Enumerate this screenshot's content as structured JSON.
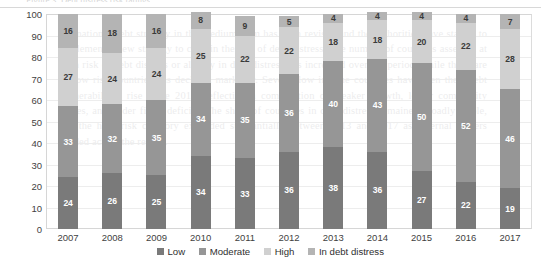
{
  "page": {
    "top_cut_text": "Figure 3. Debt distress risk ratings",
    "bleed_text": "the national debt strategy in the medium term has been revised and the authorities have started to implement a new strategy to contain the risk of debt distress. The number of countries assessed at high risk of debt distress or already in debt distress has increased over the period, while the share of low risk countries has declined markedly. Several low income countries have seen their debt vulnerabilities rise since 2013, reflecting a combination of weaker growth, lower commodity prices, and wider fiscal deficits. The share of countries in debt distress remained broadly stable, but the high risk category expanded substantially between 2013 and 2017 as external buffers eroded across the region."
  },
  "chart_data": {
    "type": "bar",
    "stacked": true,
    "title": "",
    "xlabel": "",
    "ylabel": "",
    "ylim": [
      0,
      100
    ],
    "ytick_step": 10,
    "ytick_labels": [
      "100",
      "90",
      "80",
      "70",
      "60",
      "50",
      "40",
      "30",
      "20",
      "10",
      "0"
    ],
    "grid": true,
    "legend_position": "bottom",
    "categories": [
      "2007",
      "2008",
      "2009",
      "2010",
      "2011",
      "2012",
      "2013",
      "2014",
      "2015",
      "2016",
      "2017"
    ],
    "series": [
      {
        "name": "Low",
        "color": "#7a7a7a",
        "label_color": "light-on-dark",
        "values": [
          24,
          26,
          25,
          34,
          33,
          36,
          38,
          36,
          27,
          22,
          19
        ]
      },
      {
        "name": "Moderate",
        "color": "#969696",
        "label_color": "light-on-dark",
        "values": [
          33,
          32,
          35,
          34,
          35,
          36,
          40,
          43,
          50,
          52,
          46
        ]
      },
      {
        "name": "High",
        "color": "#d0d0d0",
        "label_color": "dark-on-light",
        "values": [
          27,
          24,
          24,
          25,
          22,
          22,
          18,
          18,
          20,
          22,
          28
        ]
      },
      {
        "name": "In debt distress",
        "color": "#b4b4b4",
        "label_color": "dark-on-light",
        "values": [
          16,
          18,
          16,
          8,
          9,
          5,
          4,
          4,
          4,
          4,
          7
        ]
      }
    ]
  }
}
